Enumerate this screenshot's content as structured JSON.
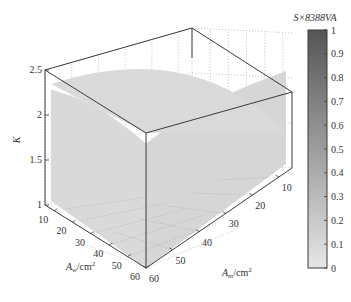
{
  "chart_data": {
    "type": "surface3d",
    "title": "",
    "zlabel": "K",
    "xlabel": {
      "main": "A",
      "sub": "w",
      "unit": "/cm",
      "sup": "2"
    },
    "ylabel": {
      "main": "A",
      "sub": "m",
      "unit": "/cm",
      "sup": "2"
    },
    "xlim": [
      5,
      60
    ],
    "ylim": [
      5,
      60
    ],
    "zlim": [
      1,
      2.5
    ],
    "x_ticks": [
      10,
      20,
      30,
      40,
      50,
      60
    ],
    "y_ticks": [
      10,
      20,
      30,
      40,
      50,
      60
    ],
    "z_ticks": [
      1,
      1.5,
      2,
      2.5
    ],
    "z_tick_labels": [
      "1",
      "1.5",
      "2",
      "2.5"
    ],
    "grid": true,
    "surface": {
      "description": "Near-vertical surface filling the front (x=60 face) and right (y=5 face) sides of the box, with a curved top edge peaking at K≈2.5 near the back corner and sloping lower toward the right.",
      "color_value": 0.15,
      "top_edge_left": [
        [
          5,
          2.35
        ],
        [
          20,
          2.45
        ],
        [
          35,
          2.5
        ],
        [
          50,
          2.48
        ],
        [
          60,
          2.45
        ]
      ],
      "top_edge_right": [
        [
          5,
          2.1
        ],
        [
          20,
          2.25
        ],
        [
          35,
          2.38
        ],
        [
          50,
          2.45
        ],
        [
          60,
          2.45
        ]
      ],
      "bottom_edge_floor_boundary": [
        [
          10,
          10
        ],
        [
          25,
          30
        ],
        [
          40,
          45
        ],
        [
          60,
          55
        ]
      ]
    },
    "colorbar": {
      "label": "S×8388VA",
      "range": [
        0,
        1
      ],
      "ticks": [
        0,
        0.1,
        0.2,
        0.3,
        0.4,
        0.5,
        0.6,
        0.7,
        0.8,
        0.9,
        1
      ],
      "tick_labels": [
        "0",
        "0.1",
        "0.2",
        "0.3",
        "0.4",
        "0.5",
        "0.6",
        "0.7",
        "0.8",
        "0.9",
        "1"
      ],
      "colormap": "gray-reversed",
      "color_low": "#e6e6e6",
      "color_high": "#555555",
      "placement": "right"
    }
  }
}
